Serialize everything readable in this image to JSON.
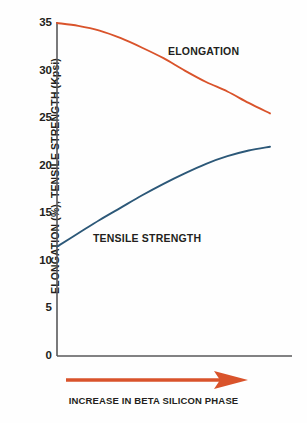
{
  "chart_data": {
    "type": "line",
    "title": "",
    "subtitle": "",
    "xlabel": "INCREASE IN BETA SILICON PHASE",
    "ylabel": "ELONGATION (%), TENSILE STRENGTH (Kpsi)",
    "xlim": [
      0,
      100
    ],
    "ylim": [
      0,
      35
    ],
    "yticks": [
      0,
      5,
      10,
      15,
      20,
      25,
      30,
      35
    ],
    "ytick_labels": [
      "0",
      "5",
      "10",
      "15",
      "20",
      "25",
      "30",
      "35"
    ],
    "xticks": [],
    "xtick_labels": [],
    "grid": false,
    "legend_position": "inline-annotation",
    "x_axis_is_qualitative": true,
    "series": [
      {
        "name": "ELONGATION",
        "color": "#d9532b",
        "label_text": "ELONGATION",
        "x": [
          0,
          10,
          20,
          30,
          40,
          50,
          60,
          70,
          80,
          90,
          100
        ],
        "values": [
          35.0,
          34.7,
          34.2,
          33.4,
          32.4,
          31.3,
          30.0,
          28.8,
          27.8,
          26.6,
          25.5
        ]
      },
      {
        "name": "TENSILE STRENGTH",
        "color": "#2c5878",
        "label_text": "TENSILE STRENGTH",
        "x": [
          0,
          10,
          20,
          30,
          40,
          50,
          60,
          70,
          80,
          90,
          100
        ],
        "values": [
          11.5,
          12.9,
          14.3,
          15.6,
          16.9,
          18.1,
          19.2,
          20.2,
          21.0,
          21.6,
          22.0
        ]
      }
    ],
    "annotations": [
      {
        "name": "increase-arrow",
        "icon": "right-arrow-icon",
        "color": "#d9532b",
        "text": "INCREASE IN BETA SILICON PHASE",
        "direction": "right"
      }
    ],
    "colors": {
      "elongation": "#d9532b",
      "tensile_strength": "#2c5878",
      "axis": "#58585a",
      "text": "#231f20",
      "background": "#fefefe"
    }
  }
}
